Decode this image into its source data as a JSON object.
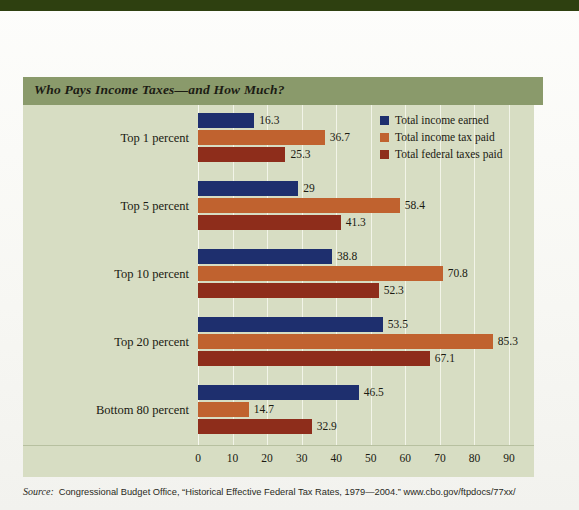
{
  "figure": {
    "title": "Who Pays Income Taxes—and How Much?",
    "title_bar_color": "#8a9a6b",
    "panel_color": "#d7ddc3",
    "top_rule_color": "#2e4010"
  },
  "source": {
    "label": "Source:",
    "text": "Congressional Budget Office, “Historical Effective Federal Tax Rates, 1979—2004.” www.cbo.gov/ftpdocs/77xx/"
  },
  "chart_data": {
    "type": "bar",
    "orientation": "horizontal",
    "title": "Who Pays Income Taxes—and How Much?",
    "xlabel": "",
    "ylabel": "",
    "xlim": [
      0,
      90
    ],
    "xticks": [
      0,
      10,
      20,
      30,
      40,
      50,
      60,
      70,
      80,
      90
    ],
    "xticklabels": [
      "0",
      "10",
      "20",
      "30",
      "40",
      "50",
      "60",
      "70",
      "80",
      "90"
    ],
    "grid": true,
    "grid_axis": "x",
    "legend_position": "top-right",
    "categories": [
      "Top 1 percent",
      "Top 5 percent",
      "Top 10 percent",
      "Top 20 percent",
      "Bottom 80 percent"
    ],
    "series": [
      {
        "name": "Total income earned",
        "color": "#1e2f6e",
        "values": [
          16.3,
          29,
          38.8,
          53.5,
          46.5
        ],
        "labels": [
          "16.3",
          "29",
          "38.8",
          "53.5",
          "46.5"
        ]
      },
      {
        "name": "Total income tax paid",
        "color": "#c0622f",
        "values": [
          36.7,
          58.4,
          70.8,
          85.3,
          14.7
        ],
        "labels": [
          "36.7",
          "58.4",
          "70.8",
          "85.3",
          "14.7"
        ]
      },
      {
        "name": "Total federal taxes paid",
        "color": "#8e2d1b",
        "values": [
          25.3,
          41.3,
          52.3,
          67.1,
          32.9
        ],
        "labels": [
          "25.3",
          "41.3",
          "52.3",
          "67.1",
          "32.9"
        ]
      }
    ]
  }
}
